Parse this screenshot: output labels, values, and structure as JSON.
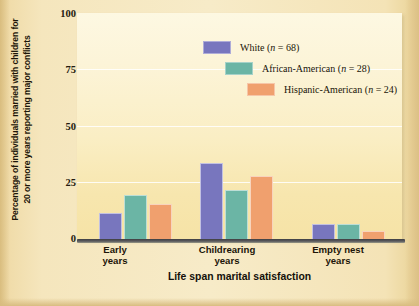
{
  "chart_data": {
    "type": "bar",
    "title": "",
    "xlabel": "Life span marital satisfaction",
    "ylabel": "Percentage of individuals married with children for 20 or more years reporting major conflicts",
    "categories": [
      "Early years",
      "Childrearing years",
      "Empty nest years"
    ],
    "category_lines": [
      [
        "Early",
        "years"
      ],
      [
        "Childrearing",
        "years"
      ],
      [
        "Empty nest",
        "years"
      ]
    ],
    "series": [
      {
        "name": "White",
        "n": 68,
        "legend_label": "White (n = 68)",
        "color": "#7876be",
        "values": [
          12,
          34,
          7
        ]
      },
      {
        "name": "African-American",
        "n": 28,
        "legend_label": "African-American (n = 28)",
        "color": "#6bb5a5",
        "values": [
          20,
          22,
          7
        ]
      },
      {
        "name": "Hispanic-American",
        "n": 24,
        "legend_label": "Hispanic-American (n = 24)",
        "color": "#f0a06e",
        "values": [
          16,
          28,
          4
        ]
      }
    ],
    "ylim": [
      0,
      100
    ],
    "yticks": [
      0,
      25,
      50,
      75,
      100
    ],
    "ytick_labels": [
      "0",
      "25",
      "50",
      "75",
      "100"
    ],
    "grid": true,
    "legend_position": "upper-center"
  },
  "colors": {
    "page_background": "#f4e3b6",
    "plot_background": "#fbf0cd",
    "gridline": "#ffffff",
    "axis": "#3f3f42",
    "text": "#1c1508"
  }
}
